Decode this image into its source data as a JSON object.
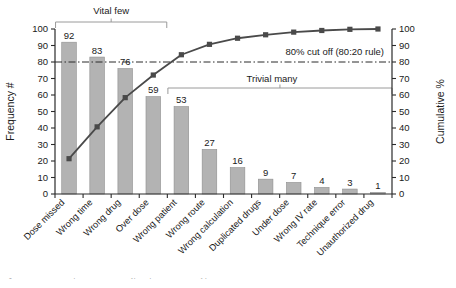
{
  "chart_data": {
    "type": "bar",
    "title": "",
    "subtitle": "",
    "xlabel": "",
    "ylabel": "Frequency #",
    "y2label": "Cumulative %",
    "ylim": [
      0,
      100
    ],
    "y2lim": [
      0,
      100
    ],
    "grid": false,
    "legend": "none",
    "categories": [
      "Dose missed",
      "Wrong time",
      "Wrong drug",
      "Over dose",
      "Wrong patient",
      "Wrong route",
      "Wrong calculation",
      "Duplicated drugs",
      "Under dose",
      "Wrong IV rate",
      "Technique error",
      "Unauthorized drug"
    ],
    "series": [
      {
        "name": "Frequency #",
        "type": "bar",
        "values": [
          92,
          83,
          76,
          59,
          53,
          27,
          16,
          9,
          7,
          4,
          3,
          1
        ]
      },
      {
        "name": "Cumulative %",
        "type": "line",
        "axis": "right",
        "values": [
          21.4,
          40.7,
          58.4,
          72.1,
          84.4,
          90.7,
          94.4,
          96.5,
          98.1,
          99.1,
          99.8,
          100.0
        ]
      }
    ],
    "bar_data_labels": [
      "92",
      "83",
      "76",
      "59",
      "53",
      "27",
      "16",
      "9",
      "7",
      "4",
      "3",
      "1"
    ],
    "y_ticks": [
      "0",
      "10",
      "20",
      "30",
      "40",
      "50",
      "60",
      "70",
      "80",
      "90",
      "100"
    ],
    "y2_ticks": [
      "0",
      "10",
      "20",
      "30",
      "40",
      "50",
      "60",
      "70",
      "80",
      "90",
      "100"
    ],
    "annotations": [
      {
        "name": "cutoff-line",
        "label": "80% cut off (80:20 rule)",
        "value": 80,
        "style": "dash-dot"
      },
      {
        "name": "vital-few-bracket",
        "label": "Vital few",
        "span_categories": [
          0,
          3
        ]
      },
      {
        "name": "trivial-many-bracket",
        "label": "Trivial many",
        "span_categories": [
          4,
          11
        ]
      }
    ]
  },
  "colors": {
    "bar_fill": "#b3b3b3",
    "bar_stroke": "#8f8f8f",
    "line": "#4a4a4a",
    "axis": "#2b2b2b",
    "cutoff": "#2b2b2b",
    "bracket": "#9a9a9a",
    "text": "#1a1a1a",
    "background": "#ffffff",
    "caption": "#8d8d8d"
  },
  "caption": {
    "text": "Fig. 2 Pareto chart of the top 12 medication error types reported over the study period in the clinical unit"
  }
}
